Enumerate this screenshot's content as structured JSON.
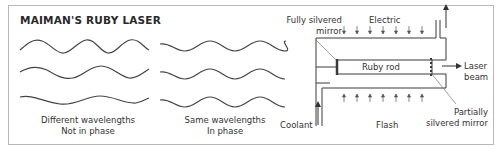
{
  "title": "MAIMAN'S RUBY LASER",
  "panels": {
    "different": {
      "caption_line1": "Different wavelengths",
      "caption_line2": "Not in phase",
      "wave_count": 3
    },
    "same": {
      "caption_line1": "Same wavelengths",
      "caption_line2": "In phase",
      "wave_count": 3
    }
  },
  "laser": {
    "labels": {
      "fully_silvered_mirror_line1": "Fully silvered",
      "fully_silvered_mirror_line2": "mirror",
      "electric": "Electric",
      "ruby_rod": "Ruby rod",
      "laser_beam_line1": "Laser",
      "laser_beam_line2": "beam",
      "coolant": "Coolant",
      "flash": "Flash",
      "partially_silvered_mirror_line1": "Partially",
      "partially_silvered_mirror_line2": "silvered mirror"
    },
    "electric_arrow_count": 7,
    "flash_arrow_count": 7
  },
  "colors": {
    "line": "#3a3a3a",
    "frame": "#b8b8b8",
    "text": "#2a2a2a"
  }
}
